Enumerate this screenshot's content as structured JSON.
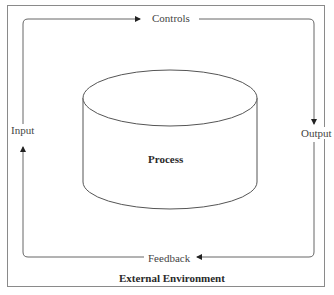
{
  "diagram": {
    "center_label": "Process",
    "footer_label": "External Environment",
    "flows": {
      "top": "Controls",
      "right": "Output",
      "bottom": "Feedback",
      "left": "Input"
    },
    "shape": "cylinder",
    "colors": {
      "line": "#555555",
      "frame": "#8a8a8a",
      "background": "#ffffff"
    }
  }
}
